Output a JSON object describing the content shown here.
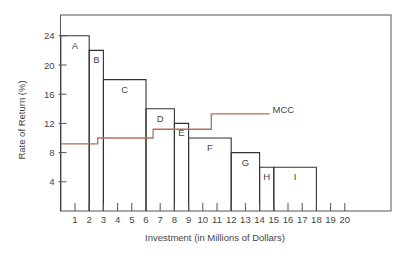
{
  "chart_data": {
    "type": "bar",
    "subtype": "step-investment-opportunity-schedule",
    "title": "",
    "xlabel": "Investment (in Millions of Dollars)",
    "ylabel": "Rate of Return (%)",
    "xlim": [
      0,
      22
    ],
    "ylim": [
      0,
      26
    ],
    "x_ticks": [
      1,
      2,
      3,
      4,
      5,
      6,
      7,
      8,
      9,
      10,
      11,
      12,
      13,
      14,
      15,
      16,
      17,
      18,
      19,
      20
    ],
    "y_ticks": [
      4,
      8,
      12,
      16,
      20,
      24
    ],
    "grid": false,
    "legend": "inline label",
    "bars": [
      {
        "label": "A",
        "x_start": 0,
        "x_end": 2,
        "value": 24
      },
      {
        "label": "B",
        "x_start": 2,
        "x_end": 3,
        "value": 22
      },
      {
        "label": "C",
        "x_start": 3,
        "x_end": 6,
        "value": 18
      },
      {
        "label": "D",
        "x_start": 6,
        "x_end": 8,
        "value": 14
      },
      {
        "label": "E",
        "x_start": 8,
        "x_end": 9,
        "value": 12
      },
      {
        "label": "F",
        "x_start": 9,
        "x_end": 12,
        "value": 10
      },
      {
        "label": "G",
        "x_start": 12,
        "x_end": 14,
        "value": 8
      },
      {
        "label": "H",
        "x_start": 14,
        "x_end": 15,
        "value": 6
      },
      {
        "label": "I",
        "x_start": 15,
        "x_end": 18,
        "value": 6
      }
    ],
    "series": [
      {
        "name": "MCC",
        "type": "step-line",
        "color": "#b36f5c",
        "segments": [
          {
            "x_start": 0,
            "x_end": 2.6,
            "value": 9.2
          },
          {
            "x_start": 2.6,
            "x_end": 6.5,
            "value": 10.0
          },
          {
            "x_start": 6.5,
            "x_end": 10.6,
            "value": 11.2
          },
          {
            "x_start": 10.6,
            "x_end": 14.7,
            "value": 13.3
          }
        ]
      }
    ]
  },
  "colors": {
    "bar_stroke": "#333333",
    "axis": "#555555",
    "mcc": "#b36f5c"
  }
}
